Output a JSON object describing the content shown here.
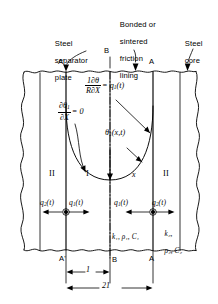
{
  "figure": {
    "callouts": [
      {
        "id": "steel-separator-plate",
        "lines": [
          "Steel",
          "separator",
          "plate"
        ]
      },
      {
        "id": "bonded-sintered-friction-lining",
        "lines": [
          "Bonded or",
          "sintered",
          "friction",
          "lining"
        ]
      },
      {
        "id": "steel-core",
        "lines": [
          "Steel",
          "core"
        ]
      }
    ],
    "section_marks": {
      "top_left": "A'",
      "top_center": "B",
      "top_right": "A",
      "bottom_left": "A'",
      "bottom_center": "B",
      "bottom_right": "A"
    },
    "equations": {
      "flux_bc": {
        "numerator": "1∂θ",
        "denominator": "R∂X",
        "equals": "= q",
        "subscript": "1",
        "argument": "(t)"
      },
      "symmetry_bc": {
        "numerator": "∂θ",
        "numerator_sub": "1",
        "denominator": "∂X",
        "equals": "= 0"
      },
      "temperature_field": {
        "symbol": "θ",
        "subscript": "1",
        "argument": "(x,t)"
      }
    },
    "regions": [
      {
        "id": "region-II-left",
        "label": "II"
      },
      {
        "id": "region-I-left",
        "label": "I"
      },
      {
        "id": "axis-x",
        "label": "x"
      },
      {
        "id": "region-II-right",
        "label": "II"
      }
    ],
    "fluxes": [
      {
        "id": "q2-left",
        "symbol": "q",
        "sub": "2",
        "arg": "(t)"
      },
      {
        "id": "q1-left",
        "symbol": "q",
        "sub": "1",
        "arg": "(t)"
      },
      {
        "id": "q1-right",
        "symbol": "q",
        "sub": "1",
        "arg": "(t)"
      },
      {
        "id": "q2-right",
        "symbol": "q",
        "sub": "2",
        "arg": "(t)"
      }
    ],
    "material_properties": {
      "lining": {
        "k": "k",
        "k_sub": "1",
        "rho": "ρ",
        "rho_sub": "1",
        "c": "C",
        "c_sub": "1",
        "text": "k₁, ρ₁, C₁"
      },
      "core": {
        "line1": "k₂,",
        "line2": "ρ₂, C₂"
      }
    },
    "dimensions": [
      {
        "id": "half-thickness",
        "label": "1"
      },
      {
        "id": "full-thickness",
        "label": "21"
      }
    ],
    "colors": {
      "ink": "#000000",
      "background": "#ffffff"
    }
  }
}
